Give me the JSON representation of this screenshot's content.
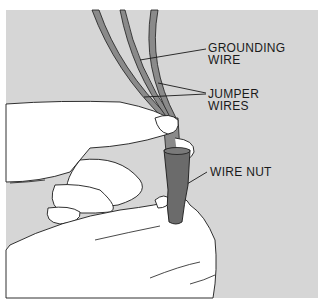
{
  "figure": {
    "background_color": "#d6d6d6",
    "wire_color": "#8a8a8a",
    "wire_nut_color": "#6b6b6b",
    "line_color": "#1a1a1a"
  },
  "labels": {
    "grounding_wire": "GROUNDING\nWIRE",
    "jumper_wires": "JUMPER\nWIRES",
    "wire_nut": "WIRE NUT"
  }
}
